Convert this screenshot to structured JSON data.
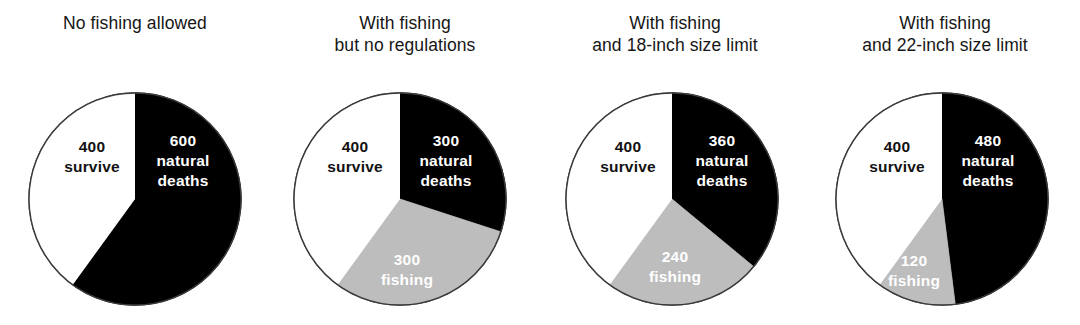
{
  "figure": {
    "background": "#ffffff",
    "width": 1080,
    "height": 325
  },
  "palette": {
    "natural_deaths": "#000000",
    "fishing": "#bdbdbd",
    "survive": "#ffffff",
    "outline": "#3a3a3a",
    "title_text": "#161616",
    "label_on_dark": "#ffffff",
    "label_on_light": "#111111"
  },
  "chart_data": {
    "type": "pie",
    "title": "",
    "legend": "in-slice labels",
    "total_per_chart": 1000,
    "start_angle_deg": 0,
    "direction": "clockwise",
    "categories": [
      "natural deaths",
      "fishing",
      "survive"
    ],
    "charts": [
      {
        "title": "No fishing allowed",
        "title_lines": [
          "No fishing allowed"
        ],
        "center": {
          "cx": 135,
          "cy": 199,
          "r": 106
        },
        "slices": [
          {
            "key": "natural_deaths",
            "value": 600,
            "value_text": "600",
            "name_lines": [
              "natural",
              "deaths"
            ],
            "color": "#000000",
            "angle_deg": 216,
            "label_fill": "on-dark",
            "label": {
              "x": 183,
              "y": 146
            }
          },
          {
            "key": "fishing",
            "value": 0,
            "value_text": "",
            "name_lines": [],
            "color": "#bdbdbd",
            "angle_deg": 0,
            "label_fill": "on-gray",
            "label": {
              "x": 0,
              "y": 0
            }
          },
          {
            "key": "survive",
            "value": 400,
            "value_text": "400",
            "name_lines": [
              "survive"
            ],
            "color": "#ffffff",
            "angle_deg": 144,
            "label_fill": "on-light",
            "label": {
              "x": 92,
              "y": 152
            }
          }
        ]
      },
      {
        "title": "With fishing but no regulations",
        "title_lines": [
          "With fishing",
          "but no regulations"
        ],
        "center": {
          "cx": 400,
          "cy": 199,
          "r": 106
        },
        "slices": [
          {
            "key": "natural_deaths",
            "value": 300,
            "value_text": "300",
            "name_lines": [
              "natural",
              "deaths"
            ],
            "color": "#000000",
            "angle_deg": 108,
            "label_fill": "on-dark",
            "label": {
              "x": 446,
              "y": 146
            }
          },
          {
            "key": "fishing",
            "value": 300,
            "value_text": "300",
            "name_lines": [
              "fishing"
            ],
            "color": "#bdbdbd",
            "angle_deg": 108,
            "label_fill": "on-gray",
            "label": {
              "x": 407,
              "y": 265
            }
          },
          {
            "key": "survive",
            "value": 400,
            "value_text": "400",
            "name_lines": [
              "survive"
            ],
            "color": "#ffffff",
            "angle_deg": 144,
            "label_fill": "on-light",
            "label": {
              "x": 355,
              "y": 152
            }
          }
        ]
      },
      {
        "title": "With fishing and 18-inch size limit",
        "title_lines": [
          "With fishing",
          "and 18-inch size limit"
        ],
        "center": {
          "cx": 672,
          "cy": 199,
          "r": 106
        },
        "slices": [
          {
            "key": "natural_deaths",
            "value": 360,
            "value_text": "360",
            "name_lines": [
              "natural",
              "deaths"
            ],
            "color": "#000000",
            "angle_deg": 129.6,
            "label_fill": "on-dark",
            "label": {
              "x": 722,
              "y": 146
            }
          },
          {
            "key": "fishing",
            "value": 240,
            "value_text": "240",
            "name_lines": [
              "fishing"
            ],
            "color": "#bdbdbd",
            "angle_deg": 86.4,
            "label_fill": "on-gray",
            "label": {
              "x": 675,
              "y": 262
            }
          },
          {
            "key": "survive",
            "value": 400,
            "value_text": "400",
            "name_lines": [
              "survive"
            ],
            "color": "#ffffff",
            "angle_deg": 144,
            "label_fill": "on-light",
            "label": {
              "x": 628,
              "y": 152
            }
          }
        ]
      },
      {
        "title": "With fishing and 22-inch size limit",
        "title_lines": [
          "With fishing",
          "and 22-inch size limit"
        ],
        "center": {
          "cx": 942,
          "cy": 199,
          "r": 106
        },
        "slices": [
          {
            "key": "natural_deaths",
            "value": 480,
            "value_text": "480",
            "name_lines": [
              "natural",
              "deaths"
            ],
            "color": "#000000",
            "angle_deg": 172.8,
            "label_fill": "on-dark",
            "label": {
              "x": 988,
              "y": 146
            }
          },
          {
            "key": "fishing",
            "value": 120,
            "value_text": "120",
            "name_lines": [
              "fishing"
            ],
            "color": "#bdbdbd",
            "angle_deg": 43.2,
            "label_fill": "on-gray",
            "label": {
              "x": 914,
              "y": 266
            }
          },
          {
            "key": "survive",
            "value": 400,
            "value_text": "400",
            "name_lines": [
              "survive"
            ],
            "color": "#ffffff",
            "angle_deg": 144,
            "label_fill": "on-light",
            "label": {
              "x": 897,
              "y": 152
            }
          }
        ]
      }
    ]
  }
}
